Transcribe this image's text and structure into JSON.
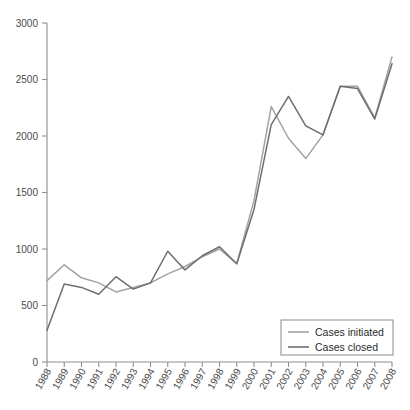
{
  "chart_data": {
    "type": "line",
    "title": "",
    "subtitle": "",
    "xlabel": "",
    "ylabel": "",
    "x": [
      1988,
      1989,
      1990,
      1991,
      1992,
      1993,
      1994,
      1995,
      1996,
      1997,
      1998,
      1999,
      2000,
      2001,
      2002,
      2003,
      2004,
      2005,
      2006,
      2007,
      2008
    ],
    "categories": [
      "1988",
      "1989",
      "1990",
      "1991",
      "1992",
      "1993",
      "1994",
      "1995",
      "1996",
      "1997",
      "1998",
      "1999",
      "2000",
      "2001",
      "2002",
      "2003",
      "2004",
      "2005",
      "2006",
      "2007",
      "2008"
    ],
    "series": [
      {
        "name": "Cases initiated",
        "color": "#a3a3a3",
        "values": [
          720,
          860,
          745,
          700,
          620,
          660,
          700,
          780,
          845,
          930,
          1000,
          870,
          1430,
          2260,
          1980,
          1800,
          2010,
          2440,
          2440,
          2160,
          2700
        ]
      },
      {
        "name": "Cases closed",
        "color": "#6e6e6e",
        "values": [
          280,
          690,
          660,
          600,
          755,
          645,
          700,
          980,
          815,
          940,
          1020,
          870,
          1350,
          2100,
          2350,
          2090,
          2010,
          2440,
          2420,
          2150,
          2640
        ]
      }
    ],
    "ylim": [
      0,
      3000
    ],
    "ytick_values": [
      0,
      500,
      1000,
      1500,
      2000,
      2500,
      3000
    ],
    "ytick_labels": [
      "0",
      "500",
      "1000",
      "1500",
      "2000",
      "2500",
      "3000"
    ],
    "xtick_labels": [
      "1988",
      "1989",
      "1990",
      "1991",
      "1992",
      "1993",
      "1994",
      "1995",
      "1996",
      "1997",
      "1998",
      "1999",
      "2000",
      "2001",
      "2002",
      "2003",
      "2004",
      "2005",
      "2006",
      "2007",
      "2008"
    ],
    "grid": false,
    "legend_position": "bottom-right",
    "legend_entries": [
      {
        "label": "Cases initiated",
        "color": "#a3a3a3"
      },
      {
        "label": "Cases closed",
        "color": "#6e6e6e"
      }
    ]
  },
  "axes": {
    "y_ticks": [
      "3000",
      "2500",
      "2000",
      "1500",
      "1000",
      "500",
      "0"
    ],
    "x_ticks": [
      "1988",
      "1989",
      "1990",
      "1991",
      "1992",
      "1993",
      "1994",
      "1995",
      "1996",
      "1997",
      "1998",
      "1999",
      "2000",
      "2001",
      "2002",
      "2003",
      "2004",
      "2005",
      "2006",
      "2007",
      "2008"
    ]
  },
  "legend": {
    "items": [
      {
        "label": "Cases initiated"
      },
      {
        "label": "Cases closed"
      }
    ]
  },
  "colors": {
    "initiated": "#a3a3a3",
    "closed": "#6e6e6e",
    "axis": "#8f8f8f",
    "text": "#4a4a4a"
  }
}
